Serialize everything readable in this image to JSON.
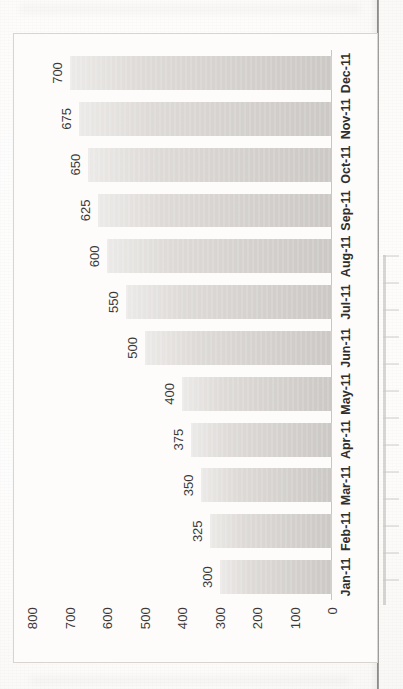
{
  "page": {
    "media": "scanned-document-page",
    "orientation": "rotated-90-clockwise"
  },
  "chart_data": {
    "type": "bar",
    "title": "",
    "subtitle": "",
    "xlabel": "",
    "ylabel": "",
    "categories": [
      "Jan-11",
      "Feb-11",
      "Mar-11",
      "Apr-11",
      "May-11",
      "Jun-11",
      "Jul-11",
      "Aug-11",
      "Sep-11",
      "Oct-11",
      "Nov-11",
      "Dec-11"
    ],
    "values": [
      300,
      325,
      350,
      375,
      400,
      500,
      550,
      600,
      625,
      650,
      675,
      700
    ],
    "data_labels": [
      "300",
      "325",
      "350",
      "375",
      "400",
      "500",
      "550",
      "600",
      "625",
      "650",
      "675",
      "700"
    ],
    "ylim": [
      0,
      800
    ],
    "yticks": [
      0,
      100,
      200,
      300,
      400,
      500,
      600,
      700,
      800
    ],
    "ytick_labels": [
      "0",
      "100",
      "200",
      "300",
      "400",
      "500",
      "600",
      "700",
      "800"
    ],
    "grid": false,
    "legend": null,
    "legend_position": "none",
    "bar_color": "#d7d4d1",
    "bar_edge_color": "#cbc8c5",
    "axis_color": "#c9c6c2",
    "text_color": "#3b3a38",
    "plot_background": "#fdfcfb"
  }
}
